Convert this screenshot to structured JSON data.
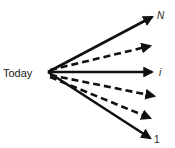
{
  "diagram": {
    "origin_label": "Today",
    "colors": {
      "stroke": "#111111",
      "text": "#1a1a1a",
      "background": "#ffffff"
    },
    "arrows": [
      {
        "id": "N",
        "label": "N",
        "style": "solid",
        "italic": true
      },
      {
        "id": "d1",
        "label": "",
        "style": "dashed"
      },
      {
        "id": "i",
        "label": "i",
        "style": "solid",
        "italic": true
      },
      {
        "id": "d2",
        "label": "",
        "style": "dashed"
      },
      {
        "id": "d3",
        "label": "",
        "style": "dashed"
      },
      {
        "id": "one",
        "label": "1",
        "style": "solid",
        "italic": false
      }
    ]
  }
}
